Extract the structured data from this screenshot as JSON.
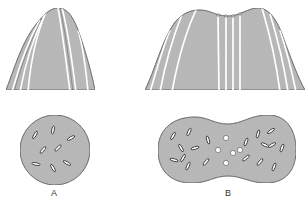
{
  "figure": {
    "panels": [
      {
        "id": "A",
        "label": "A",
        "top_view": "single-peaked conical structure with longitudinal striations",
        "bottom_view": "circular cross-section with scattered elongated inclusions",
        "inclusion_count": 8
      },
      {
        "id": "B",
        "label": "B",
        "top_view": "double-humped structure with central parallel striations",
        "bottom_view": "dumbbell-shaped cross-section with elongated inclusions and central round vacuoles",
        "inclusion_count": 18,
        "vacuole_count": 5
      }
    ],
    "colors": {
      "fill": "#b9b9b9",
      "outline": "#3a3a3a",
      "stripe": "#ffffff",
      "background": "#ffffff"
    }
  }
}
